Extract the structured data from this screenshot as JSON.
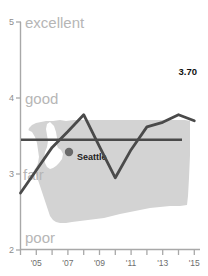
{
  "chart_data": {
    "type": "line",
    "title": "",
    "subtitle": "",
    "xlabel": "",
    "ylabel": "",
    "xlim": [
      2004,
      2015.4
    ],
    "ylim": [
      2,
      5
    ],
    "grid": false,
    "legend": null,
    "x": [
      2004,
      2005,
      2006,
      2007,
      2008,
      2009,
      2010,
      2011,
      2012,
      2013,
      2014,
      2015
    ],
    "series": [
      {
        "name": "rating",
        "values": [
          2.75,
          3.05,
          3.35,
          3.56,
          3.78,
          3.36,
          2.95,
          3.32,
          3.62,
          3.68,
          3.78,
          3.7
        ]
      }
    ],
    "reference_line": {
      "name": "average",
      "value": 3.45,
      "orientation": "horizontal"
    },
    "end_value_label": "3.70",
    "y_axis": {
      "ticks": [
        2,
        3,
        4,
        5
      ],
      "tick_labels": [
        "2",
        "3",
        "4",
        "5"
      ],
      "qualitative_labels": [
        {
          "value": 5,
          "text": "excellent"
        },
        {
          "value": 4,
          "text": "good"
        },
        {
          "value": 3,
          "text": "fair"
        },
        {
          "value": 2,
          "text": "poor"
        }
      ]
    },
    "x_axis": {
      "ticks": [
        2004,
        2005,
        2006,
        2007,
        2008,
        2009,
        2010,
        2011,
        2012,
        2013,
        2014,
        2015
      ],
      "labeled_ticks": [
        2005,
        2007,
        2009,
        2011,
        2013,
        2015
      ],
      "tick_labels": [
        "'05",
        "'07",
        "'09",
        "'11",
        "'13",
        "'15"
      ]
    },
    "map_overlay": {
      "name": "washington-state",
      "city_marker": {
        "label": "Seattle",
        "x": 69,
        "y": 152
      }
    }
  },
  "colors": {
    "line": "#4a4a4a",
    "reference_line": "#4a4a4a",
    "axis": "#a8a8a8",
    "map_fill": "#d3d3d3",
    "qualitative_text": "#b6b6b6",
    "tick_text": "#6e6e6e",
    "value_text": "#111111",
    "background": "#ffffff"
  }
}
